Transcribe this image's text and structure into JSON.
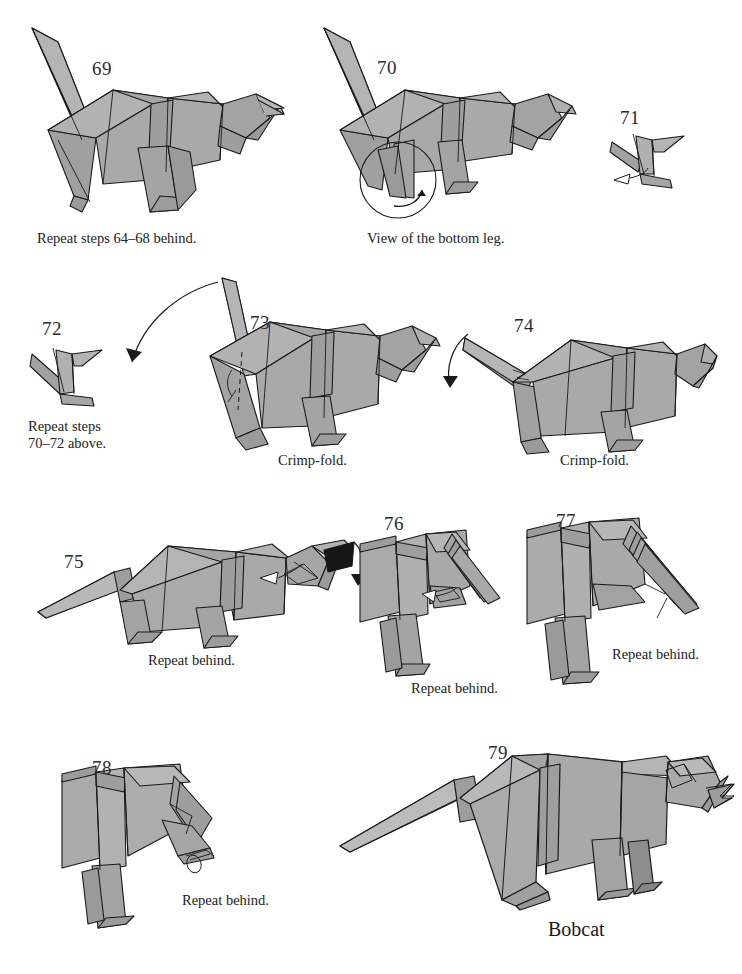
{
  "document": {
    "type": "origami-diagram-page",
    "model_name": "Bobcat",
    "paper_fill": "#a9a9a9",
    "paper_fill_dark": "#8d8d8d",
    "paper_fill_darker": "#6f6f6f",
    "paper_fill_light": "#bcbcbc",
    "paper_black": "#171717",
    "line_color": "#1a1a1a",
    "background": "#ffffff"
  },
  "steps": [
    {
      "number": "69",
      "caption": "Repeat steps 64–68 behind.",
      "figure": "bobcat-rear-view-legs-spread"
    },
    {
      "number": "70",
      "caption": "View of the bottom leg.",
      "figure": "bobcat-with-magnifier-circle-on-bottom-leg"
    },
    {
      "number": "71",
      "caption": "",
      "figure": "leg-detail-closeup"
    },
    {
      "number": "72",
      "caption": "Repeat steps\n70–72 above.",
      "figure": "leg-detail-closeup-folded"
    },
    {
      "number": "73",
      "caption": "Crimp-fold.",
      "figure": "bobcat-standing-tail-up"
    },
    {
      "number": "74",
      "caption": "Crimp-fold.",
      "figure": "bobcat-standing-tail-lowered"
    },
    {
      "number": "75",
      "caption": "Repeat behind.",
      "figure": "bobcat-full-body-head-detail"
    },
    {
      "number": "76",
      "caption": "Repeat behind.",
      "figure": "bobcat-head-closeup-ears"
    },
    {
      "number": "77",
      "caption": "Repeat behind.",
      "figure": "bobcat-head-closeup-ear-fold"
    },
    {
      "number": "78",
      "caption": "Repeat behind.",
      "figure": "bobcat-head-closeup-finished-face"
    },
    {
      "number": "79",
      "caption": "",
      "figure": "bobcat-completed-model"
    }
  ],
  "footer": {
    "model_label": "Bobcat"
  }
}
